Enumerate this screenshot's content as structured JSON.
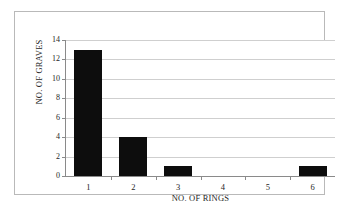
{
  "chart_data": {
    "type": "bar",
    "title": "",
    "xlabel": "NO. OF RINGS",
    "ylabel": "NO. OF GRAVES",
    "categories": [
      "1",
      "2",
      "3",
      "4",
      "5",
      "6"
    ],
    "values": [
      13,
      4,
      1,
      0,
      0,
      1
    ],
    "ylim": [
      0,
      14
    ],
    "yticks": [
      0,
      2,
      4,
      6,
      8,
      10,
      12,
      14
    ],
    "ytick_labels": [
      "0",
      "2",
      "4",
      "6",
      "8",
      "10",
      "12",
      "14"
    ],
    "grid": true,
    "grid_axis": "y",
    "legend": false,
    "bar_color": "#0d0d0d",
    "grid_color": "#cfcfcf",
    "axis_color": "#8a8a8a",
    "frame_color": "#b9b9b9",
    "background": "#ffffff"
  }
}
